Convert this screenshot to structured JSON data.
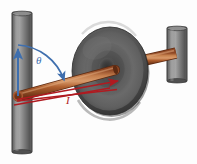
{
  "figure": {
    "kind": "physics-diagram",
    "background_color": "#fdfdfd"
  },
  "labels": {
    "angle": {
      "text": "θ",
      "color": "#3f6fae",
      "x": 36,
      "y": 64
    },
    "current": {
      "text": "I",
      "color": "#b01a20",
      "x": 66,
      "y": 102
    }
  },
  "colors": {
    "post_light": "#9a9a9a",
    "post_mid": "#6e6e6e",
    "post_dark": "#4a4a4a",
    "post_outline": "#3a3a3a",
    "disk_light": "#6b6b6b",
    "disk_mid": "#555555",
    "disk_dark": "#2f2f2f",
    "rod_light": "#d0895a",
    "rod_mid": "#b4643a",
    "rod_dark": "#7e3d20",
    "arrow_blue": "#3f6fae",
    "arrow_red": "#b01a20",
    "pivot_ring": "#a85a32"
  },
  "parts": {
    "left_post": {
      "name": "left vertical post",
      "x": 12,
      "y": 12,
      "width": 20,
      "height": 141
    },
    "right_post": {
      "name": "right vertical post",
      "x": 167,
      "y": 27,
      "width": 20,
      "height": 55
    },
    "disk": {
      "name": "central disk",
      "cx": 110,
      "cy": 71,
      "rx": 38,
      "ry": 44
    },
    "rod": {
      "name": "copper rod",
      "x1": 18,
      "y1": 96,
      "x2": 176,
      "y2": 53
    },
    "pivot": {
      "name": "pivot ring",
      "cx": 18,
      "cy": 96,
      "r": 4
    }
  },
  "vectors": {
    "vertical_reference": {
      "name": "vertical reference arrow",
      "color": "#3f6fae",
      "x1": 18,
      "y1": 96,
      "x2": 18,
      "y2": 48
    },
    "angle_arc": {
      "name": "angle arc from vertical to rod",
      "color": "#3f6fae"
    },
    "current_arrow_upper": {
      "name": "current arrow along rod",
      "color": "#b01a20"
    },
    "current_arrow_lower": {
      "name": "current return arrow",
      "color": "#b01a20"
    }
  }
}
